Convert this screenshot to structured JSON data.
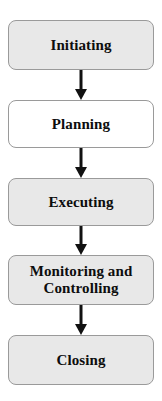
{
  "diagram": {
    "type": "vertical-flowchart",
    "background_color": "#ffffff",
    "node_border_color": "#9a9a9a",
    "node_fill_shaded": "#e8e8e8",
    "node_fill_plain": "#ffffff",
    "arrow_color": "#111111",
    "nodes": [
      {
        "id": "initiating",
        "label": "Initiating",
        "fill": "#e8e8e8",
        "x": 8,
        "y": 20,
        "width": 146,
        "height": 50
      },
      {
        "id": "planning",
        "label": "Planning",
        "fill": "#ffffff",
        "x": 8,
        "y": 100,
        "width": 146,
        "height": 48
      },
      {
        "id": "executing",
        "label": "Executing",
        "fill": "#e8e8e8",
        "x": 8,
        "y": 178,
        "width": 146,
        "height": 48
      },
      {
        "id": "monitoring-and-controlling",
        "label": "Monitoring and\nControlling",
        "fill": "#e8e8e8",
        "x": 8,
        "y": 255,
        "width": 146,
        "height": 50
      },
      {
        "id": "closing",
        "label": "Closing",
        "fill": "#e8e8e8",
        "x": 8,
        "y": 335,
        "width": 146,
        "height": 50
      }
    ],
    "arrows": [
      {
        "id": "arrow-initiating-to-planning",
        "from": "initiating",
        "to": "planning",
        "x": 81,
        "y_start": 70,
        "y_end": 100
      },
      {
        "id": "arrow-planning-to-executing",
        "from": "planning",
        "to": "executing",
        "x": 81,
        "y_start": 148,
        "y_end": 178
      },
      {
        "id": "arrow-executing-to-monitoring",
        "from": "executing",
        "to": "monitoring-and-controlling",
        "x": 81,
        "y_start": 226,
        "y_end": 255
      },
      {
        "id": "arrow-monitoring-to-closing",
        "from": "monitoring-and-controlling",
        "to": "closing",
        "x": 81,
        "y_start": 305,
        "y_end": 335
      }
    ]
  }
}
